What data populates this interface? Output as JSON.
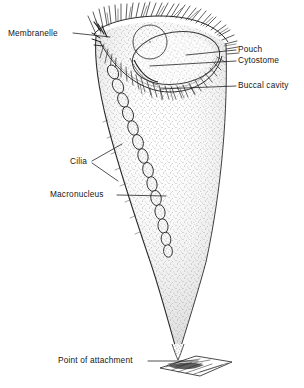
{
  "figure": {
    "organism": "Stentor",
    "style": "black ink stipple line drawing",
    "background_color": "#ffffff",
    "ink_color": "#171717"
  },
  "labels": [
    {
      "id": "membranelle",
      "text": "Membranelle",
      "side": "left",
      "x": 8,
      "y": 29
    },
    {
      "id": "pouch",
      "text": "Pouch",
      "side": "right",
      "x": 238,
      "y": 47
    },
    {
      "id": "cytostome",
      "text": "Cytostome",
      "side": "right",
      "x": 238,
      "y": 58
    },
    {
      "id": "buccal-cavity",
      "text": "Buccal cavity",
      "side": "right",
      "x": 238,
      "y": 83
    },
    {
      "id": "cilia",
      "text": "Cilia",
      "side": "left",
      "x": 70,
      "y": 159
    },
    {
      "id": "macronucleus",
      "text": "Macronucleus",
      "side": "left",
      "x": 50,
      "y": 192
    },
    {
      "id": "point-of-attachment",
      "text": "Point of attachment",
      "side": "left",
      "x": 58,
      "y": 358
    }
  ],
  "leader_lines": [
    {
      "id": "leader-membranelle",
      "from": [
        73,
        33
      ],
      "to": [
        110,
        37
      ]
    },
    {
      "id": "leader-pouch",
      "from": [
        236,
        50
      ],
      "to": [
        186,
        55
      ]
    },
    {
      "id": "leader-cytostome",
      "from": [
        236,
        61
      ],
      "to": [
        150,
        66
      ]
    },
    {
      "id": "leader-buccal-cavity",
      "from": [
        236,
        86
      ],
      "to": [
        160,
        89
      ]
    },
    {
      "id": "leader-cilia-a",
      "from": [
        92,
        161
      ],
      "to": [
        122,
        144
      ]
    },
    {
      "id": "leader-cilia-b",
      "from": [
        92,
        163
      ],
      "to": [
        118,
        181
      ]
    },
    {
      "id": "leader-macronucleus",
      "from": [
        117,
        195
      ],
      "to": [
        166,
        196
      ]
    },
    {
      "id": "leader-attachment",
      "from": [
        148,
        361
      ],
      "to": [
        198,
        361
      ]
    }
  ],
  "structures": {
    "body": {
      "name": "cone-shaped cell body",
      "description": "inverted-cone trumpet body, stippled interior, widest at the oral rim and tapering to a fine stalk point"
    },
    "oral_rim": {
      "name": "peristome rim with ciliary fringe",
      "description": "dense fringe of fine cilia along the broad upper margin"
    },
    "macronucleus": {
      "name": "beaded macronucleus",
      "description": "moesiform chain of elongated oval beads running diagonally through the cytoplasm",
      "bead_count": 14
    },
    "contractile_vacuole": {
      "name": "contractile vacuole",
      "description": "small circle near the upper left of the peristome"
    },
    "pouch_oval": {
      "name": "pouch",
      "description": "large oval depression set into the oral region"
    },
    "substrate": {
      "name": "substrate at point of attachment",
      "description": "flat hatched surface the holdfast grips"
    }
  }
}
